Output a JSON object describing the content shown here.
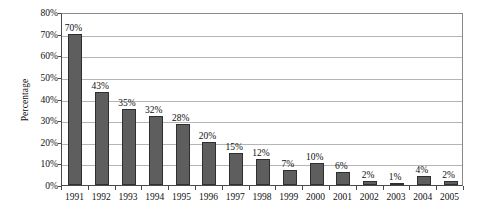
{
  "chart_data": {
    "type": "bar",
    "title": "",
    "subtitle": "",
    "xlabel": "",
    "ylabel": "Percentage",
    "categories": [
      "1991",
      "1992",
      "1993",
      "1994",
      "1995",
      "1996",
      "1997",
      "1998",
      "1999",
      "2000",
      "2001",
      "2002",
      "2003",
      "2004",
      "2005"
    ],
    "values": [
      70,
      43,
      35,
      32,
      28,
      20,
      15,
      12,
      7,
      10,
      6,
      2,
      1,
      4,
      2
    ],
    "data_labels": [
      "70%",
      "43%",
      "35%",
      "32%",
      "28%",
      "20%",
      "15%",
      "12%",
      "7%",
      "10%",
      "6%",
      "2%",
      "1%",
      "4%",
      "2%"
    ],
    "ylim": [
      0,
      80
    ],
    "ytick_values": [
      0,
      10,
      20,
      30,
      40,
      50,
      60,
      70,
      80
    ],
    "ytick_labels": [
      "0%",
      "10%",
      "20%",
      "30%",
      "40%",
      "50%",
      "60%",
      "70%",
      "80%"
    ],
    "grid": "horizontal",
    "legend": "none",
    "series_color": "#5e5e5e",
    "gridline_color": "#b5b5b5",
    "axis_color": "#4a4a4a",
    "text_color": "#101010",
    "background": "#ffffff"
  }
}
